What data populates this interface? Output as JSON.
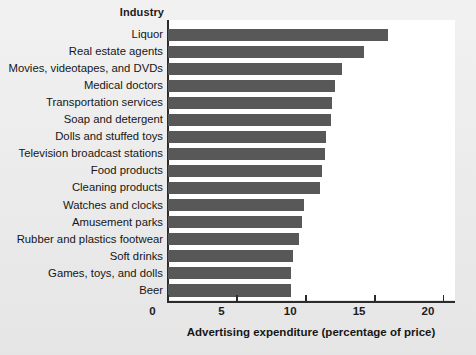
{
  "figure": {
    "background_color": "#eaeaea",
    "panel_color": "#ffffff",
    "bar_color": "#585858",
    "axis_color": "#2b2b2b"
  },
  "header": {
    "category_column_title": "Industry"
  },
  "axis": {
    "x_title": "Advertising expenditure (percentage of price)",
    "ticks": [
      "0",
      "5",
      "10",
      "15",
      "20"
    ]
  },
  "chart_data": {
    "type": "bar",
    "orientation": "horizontal",
    "title": "",
    "xlabel": "Advertising expenditure (percentage of price)",
    "ylabel": "Industry",
    "xlim": [
      0,
      20
    ],
    "xticks": [
      0,
      5,
      10,
      15,
      20
    ],
    "grid": false,
    "legend": false,
    "categories": [
      "Liquor",
      "Real estate agents",
      "Movies, videotapes, and DVDs",
      "Medical doctors",
      "Transportation services",
      "Soap and detergent",
      "Dolls and stuffed toys",
      "Television broadcast stations",
      "Food products",
      "Cleaning products",
      "Watches and clocks",
      "Amusement parks",
      "Rubber and plastics footwear",
      "Soft drinks",
      "Games, toys, and dolls",
      "Beer"
    ],
    "values": [
      16.0,
      14.2,
      12.6,
      12.1,
      11.9,
      11.8,
      11.5,
      11.4,
      11.2,
      11.0,
      9.9,
      9.7,
      9.5,
      9.1,
      8.9,
      8.9
    ]
  }
}
